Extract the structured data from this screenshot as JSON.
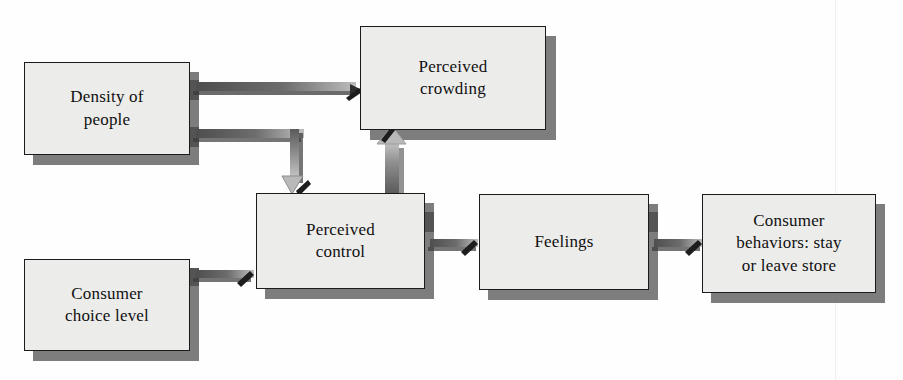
{
  "figure": {
    "type": "flow-diagram",
    "background_color": "#fefefe",
    "node_fill": "#ececeb",
    "node_border": "#1b1b1b",
    "shadow_color": "#7d7d7d",
    "connector_color": "#585858"
  },
  "nodes": [
    {
      "id": "density-of-people",
      "line1": "Density of",
      "line2": "people",
      "x": 24,
      "y": 62,
      "w": 166,
      "h": 93
    },
    {
      "id": "perceived-crowding",
      "line1": "Perceived",
      "line2": "crowding",
      "x": 360,
      "y": 26,
      "w": 186,
      "h": 104
    },
    {
      "id": "perceived-control",
      "line1": "Perceived",
      "line2": "control",
      "x": 256,
      "y": 193,
      "w": 169,
      "h": 96
    },
    {
      "id": "feelings",
      "line1": "Feelings",
      "line2": "",
      "x": 479,
      "y": 194,
      "w": 170,
      "h": 96
    },
    {
      "id": "consumer-behaviors",
      "line1": "Consumer",
      "line2": "behaviors: stay",
      "line3": "or leave store",
      "x": 702,
      "y": 194,
      "w": 174,
      "h": 99
    },
    {
      "id": "consumer-choice-level",
      "line1": "Consumer",
      "line2": "choice level",
      "x": 24,
      "y": 259,
      "w": 166,
      "h": 92
    }
  ],
  "connections": [
    {
      "id": "density-to-crowding",
      "from": "density-of-people",
      "to": "perceived-crowding"
    },
    {
      "id": "density-to-control",
      "from": "density-of-people",
      "to": "perceived-control"
    },
    {
      "id": "control-to-crowding",
      "from": "perceived-control",
      "to": "perceived-crowding"
    },
    {
      "id": "choice-to-control",
      "from": "consumer-choice-level",
      "to": "perceived-control"
    },
    {
      "id": "control-to-feelings",
      "from": "perceived-control",
      "to": "feelings"
    },
    {
      "id": "feelings-to-behaviors",
      "from": "feelings",
      "to": "consumer-behaviors"
    }
  ]
}
